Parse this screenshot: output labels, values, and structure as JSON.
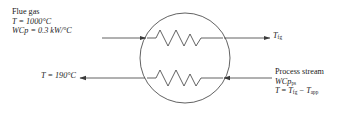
{
  "diagram": {
    "line_color": "#3a3a3a",
    "background": "#ffffff",
    "exchanger": {
      "shape": "circle",
      "cx": 185,
      "cy": 58,
      "r": 45,
      "zigzag_top_y": 38,
      "zigzag_bottom_y": 78
    },
    "streams": {
      "flue_gas_in": {
        "name": "Flue gas",
        "temperature": "T = 1000°C",
        "heat_capacity_flow": "WCp = 0.3 kW/°C",
        "arrow": "right"
      },
      "flue_gas_out": {
        "label_symbol": "T",
        "label_subscript": "fg",
        "arrow": "right"
      },
      "flue_gas_cold_out": {
        "temperature": "T = 190°C",
        "arrow": "left"
      },
      "process_stream_in": {
        "name": "Process stream",
        "heat_capacity_symbol": "WCp",
        "heat_capacity_subscript": "ps",
        "temp_symbol": "T",
        "temp_eq_lhs": " = ",
        "temp_term1_symbol": "T",
        "temp_term1_subscript": "fg",
        "temp_operator": " − ",
        "temp_term2_symbol": "T",
        "temp_term2_subscript": "app",
        "arrow": "left"
      }
    }
  }
}
